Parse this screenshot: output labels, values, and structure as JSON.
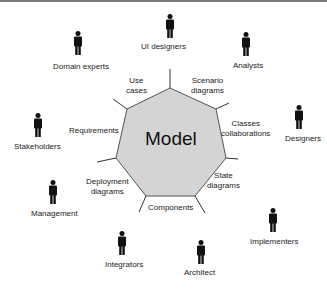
{
  "diagram": {
    "center_label": "Model",
    "center_fill": "#d4d4d4",
    "views": [
      {
        "label": "Use\ncases"
      },
      {
        "label": "Scenario\ndiagrams"
      },
      {
        "label": "Classes\ncollaborations"
      },
      {
        "label": "State\ndiagrams"
      },
      {
        "label": "Components"
      },
      {
        "label": "Deployment\ndiagrams"
      },
      {
        "label": "Requirements"
      }
    ],
    "roles": [
      {
        "label": "UI designers"
      },
      {
        "label": "Analysts"
      },
      {
        "label": "Designers"
      },
      {
        "label": "Implementers"
      },
      {
        "label": "Architect"
      },
      {
        "label": "Integrators"
      },
      {
        "label": "Management"
      },
      {
        "label": "Stakeholders"
      },
      {
        "label": "Domain experts"
      }
    ]
  }
}
